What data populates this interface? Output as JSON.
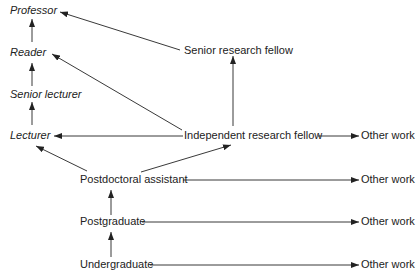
{
  "diagram": {
    "nodes": {
      "professor": "Professor",
      "reader": "Reader",
      "senior_lecturer": "Senior lecturer",
      "lecturer": "Lecturer",
      "senior_research_fellow": "Senior research fellow",
      "independent_research_fellow": "Independent research fellow",
      "postdoctoral_assistant": "Postdoctoral assistant",
      "postgraduate": "Postgraduate",
      "undergraduate": "Undergraduate",
      "other_work": "Other work"
    },
    "edges": [
      [
        "Undergraduate",
        "Postgraduate"
      ],
      [
        "Undergraduate",
        "Other work"
      ],
      [
        "Postgraduate",
        "Postdoctoral assistant"
      ],
      [
        "Postgraduate",
        "Other work"
      ],
      [
        "Postdoctoral assistant",
        "Lecturer"
      ],
      [
        "Postdoctoral assistant",
        "Independent research fellow"
      ],
      [
        "Postdoctoral assistant",
        "Other work"
      ],
      [
        "Independent research fellow",
        "Lecturer"
      ],
      [
        "Independent research fellow",
        "Reader"
      ],
      [
        "Independent research fellow",
        "Senior research fellow"
      ],
      [
        "Independent research fellow",
        "Other work"
      ],
      [
        "Senior research fellow",
        "Professor"
      ],
      [
        "Lecturer",
        "Senior lecturer"
      ],
      [
        "Senior lecturer",
        "Reader"
      ],
      [
        "Reader",
        "Professor"
      ]
    ]
  }
}
